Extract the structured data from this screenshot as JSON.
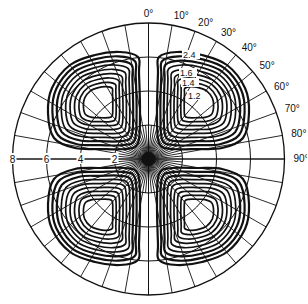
{
  "chart_data": {
    "type": "polar-contour",
    "title": "",
    "angle_labels": [
      "0°",
      "10°",
      "20°",
      "30°",
      "40°",
      "50°",
      "60°",
      "70°",
      "80°",
      "90°"
    ],
    "angle_ticks_deg": [
      0,
      10,
      20,
      30,
      40,
      50,
      60,
      70,
      80,
      90
    ],
    "radial_labels": [
      "8",
      "6",
      "4",
      "2"
    ],
    "radial_values": [
      8,
      6,
      4,
      2
    ],
    "radial_max": 8,
    "grid": {
      "radial_spoke_step_deg": 10,
      "inner_spoke_step_deg": 5,
      "rings": [
        2,
        4,
        6,
        8
      ]
    },
    "contour_labels": [
      "2.4",
      "1.6",
      "1.4",
      "1.2"
    ],
    "lobes": 4,
    "lobe_quadrants": [
      "upper-left",
      "upper-right",
      "lower-left",
      "lower-right"
    ],
    "contours_per_lobe": 9
  },
  "colors": {
    "ink": "#111111",
    "background": "#ffffff"
  }
}
